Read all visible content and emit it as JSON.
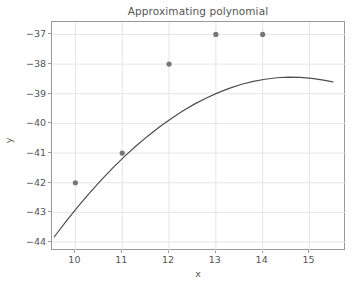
{
  "chart_data": {
    "type": "scatter",
    "title": "Approximating polynomial",
    "xlabel": "x",
    "ylabel": "y",
    "xlim": [
      9.5,
      15.78
    ],
    "ylim": [
      -44.3,
      -36.58
    ],
    "xticks": [
      "10",
      "11",
      "12",
      "13",
      "14",
      "15"
    ],
    "xtick_values": [
      10,
      11,
      12,
      13,
      14,
      15
    ],
    "yticks": [
      "−37",
      "−38",
      "−39",
      "−40",
      "−41",
      "−42",
      "−43",
      "−44"
    ],
    "ytick_values": [
      -37,
      -38,
      -39,
      -40,
      -41,
      -42,
      -43,
      -44
    ],
    "grid": true,
    "legend": null,
    "series": [
      {
        "name": "data points",
        "type": "scatter",
        "marker": "circle",
        "color": "#777777",
        "x": [
          10,
          11,
          12,
          13,
          14
        ],
        "y": [
          -42,
          -41,
          -38,
          -37,
          -37
        ]
      },
      {
        "name": "fitted polynomial",
        "type": "line",
        "color": "#4d4d4d",
        "x": [
          9.55,
          9.8,
          10.05,
          10.3,
          10.55,
          10.8,
          11.05,
          11.3,
          11.55,
          11.8,
          12.05,
          12.3,
          12.55,
          12.8,
          13.05,
          13.3,
          13.55,
          13.8,
          14.05,
          14.3,
          14.55,
          14.8,
          15.05,
          15.3,
          15.5
        ],
        "y": [
          -43.82,
          -43.3,
          -42.81,
          -42.35,
          -41.91,
          -41.5,
          -41.11,
          -40.75,
          -40.42,
          -40.11,
          -39.83,
          -39.57,
          -39.34,
          -39.14,
          -38.96,
          -38.81,
          -38.68,
          -38.58,
          -38.51,
          -38.46,
          -38.44,
          -38.45,
          -38.48,
          -38.54,
          -38.6
        ]
      }
    ]
  }
}
